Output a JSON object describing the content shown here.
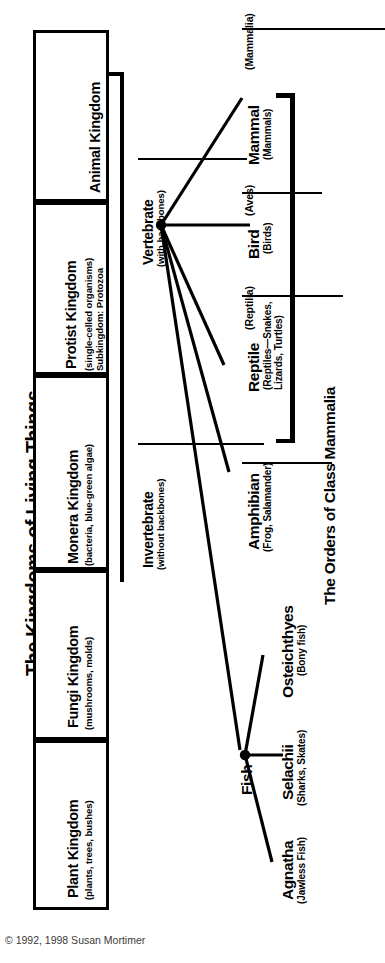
{
  "title": "The Kingdoms of Living Things",
  "copyright": "© 1992, 1998 Susan Mortimer",
  "kingdoms": [
    {
      "name": "Animal Kingdom",
      "sub": ""
    },
    {
      "name": "Protist Kingdom",
      "sub": "(single-celled organisms)\nSubkingdom: Protozoa"
    },
    {
      "name": "Monera Kingdom",
      "sub": "(bacteria, blue-green algae)"
    },
    {
      "name": "Fungi Kingdom",
      "sub": "(mushrooms, molds)"
    },
    {
      "name": "Plant Kingdom",
      "sub": "(plants, trees, bushes)"
    }
  ],
  "groups": [
    {
      "name": "Vertebrate",
      "sub": "(with backbones)"
    },
    {
      "name": "Invertebrate",
      "sub": "(without backbones)"
    }
  ],
  "classes": [
    {
      "name": "Mammal",
      "sci": "(Mammalia)",
      "sub": "(Mammals)"
    },
    {
      "name": "Bird",
      "sci": "(Aves)",
      "sub": "(Birds)"
    },
    {
      "name": "Reptile",
      "sci": "(Reptilia)",
      "sub": "(Reptiles—Snakes,\nLizards, Turtles)"
    },
    {
      "name": "Amphibian",
      "sci": "",
      "sub": "(Frog, Salamander)"
    },
    {
      "name": "Fish",
      "sci": "",
      "sub": ""
    },
    {
      "name": "Osteichthyes",
      "sci": "",
      "sub": "(Bony fish)"
    },
    {
      "name": "Selachii",
      "sci": "",
      "sub": "(Sharks, Skates)"
    },
    {
      "name": "Agnatha",
      "sci": "",
      "sub": "(Jawless Fish)"
    }
  ],
  "mammalia_bracket_label": "The Orders of Class Mammalia",
  "colors": {
    "ink": "#000000",
    "paper": "#ffffff",
    "footer": "#3a3a3a"
  },
  "chart_data": {
    "type": "diagram",
    "title": "The Kingdoms of Living Things",
    "nodes": [
      "Animal Kingdom",
      "Protist Kingdom",
      "Monera Kingdom",
      "Fungi Kingdom",
      "Plant Kingdom",
      "Vertebrate",
      "Invertebrate",
      "Mammal",
      "Bird",
      "Reptile",
      "Amphibian",
      "Fish",
      "Osteichthyes",
      "Selachii",
      "Agnatha"
    ],
    "edges": [
      [
        "Animal Kingdom",
        "Vertebrate"
      ],
      [
        "Animal Kingdom",
        "Invertebrate"
      ],
      [
        "Vertebrate",
        "Mammal"
      ],
      [
        "Vertebrate",
        "Bird"
      ],
      [
        "Vertebrate",
        "Reptile"
      ],
      [
        "Vertebrate",
        "Amphibian"
      ],
      [
        "Vertebrate",
        "Fish"
      ],
      [
        "Fish",
        "Osteichthyes"
      ],
      [
        "Fish",
        "Selachii"
      ],
      [
        "Fish",
        "Agnatha"
      ],
      [
        "Mammal",
        "The Orders of Class Mammalia"
      ]
    ]
  }
}
